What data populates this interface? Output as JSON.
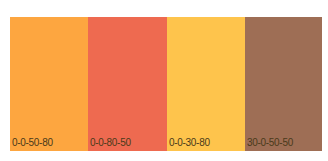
{
  "swatches": [
    {
      "label": "0-0-50-80",
      "color": "#fda640",
      "width": 78
    },
    {
      "label": "0-0-80-50",
      "color": "#ee6a50",
      "width": 79
    },
    {
      "label": "0-0-30-80",
      "color": "#fec44c",
      "width": 78
    },
    {
      "label": "30-0-50-50",
      "color": "#9e6e55",
      "width": 77
    }
  ]
}
